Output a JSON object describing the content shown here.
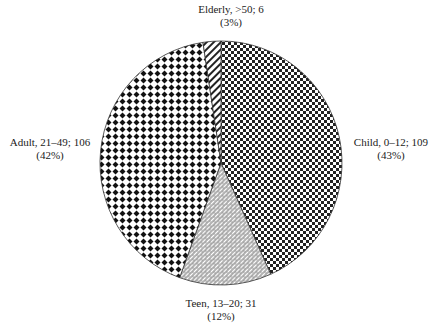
{
  "chart_data": {
    "type": "pie",
    "title": "",
    "categories": [
      "Child, 0–12",
      "Teen, 13–20",
      "Adult, 21–49",
      "Elderly, >50"
    ],
    "values": [
      109,
      31,
      106,
      6
    ],
    "percentages": [
      43,
      12,
      42,
      3
    ],
    "start_angle_deg": 0,
    "direction": "clockwise",
    "elderly_position": "top, just left of 12 o'clock",
    "fills": {
      "child": "fine checkerboard pattern",
      "teen": "diagonal brick/hatch pattern",
      "adult": "diamond dot grid pattern",
      "elderly": "diagonal stripes"
    },
    "legend": "none (direct labels)"
  },
  "labels": {
    "child": {
      "line1": "Child, 0–12; 109",
      "line2": "(43%)"
    },
    "teen": {
      "line1": "Teen, 13–20; 31",
      "line2": "(12%)"
    },
    "adult": {
      "line1": "Adult, 21–49; 106",
      "line2": "(42%)"
    },
    "elderly": {
      "line1": "Elderly, >50; 6",
      "line2": "(3%)"
    }
  }
}
